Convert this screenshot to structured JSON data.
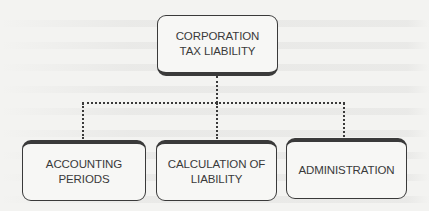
{
  "diagram": {
    "type": "org-chart",
    "root": {
      "label_line1": "CORPORATION",
      "label_line2": "TAX LIABILITY"
    },
    "children": [
      {
        "label_line1": "ACCOUNTING",
        "label_line2": "PERIODS"
      },
      {
        "label_line1": "CALCULATION OF",
        "label_line2": "LIABILITY"
      },
      {
        "label_line1": "ADMINISTRATION",
        "label_line2": ""
      }
    ],
    "connector_style": "dotted",
    "colors": {
      "border": "#3a3a3a",
      "text": "#3a3a3a",
      "background": "#f3f3f1"
    }
  }
}
